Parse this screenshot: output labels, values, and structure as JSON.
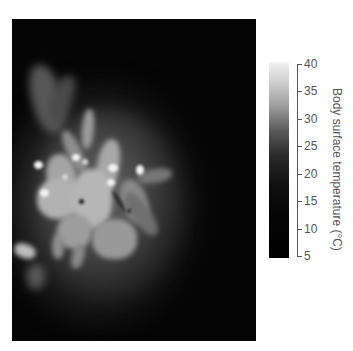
{
  "figure": {
    "type": "thermal-image"
  },
  "colorbar": {
    "title": "Body surface temperature (°C)",
    "ticks": [
      "40",
      "35",
      "30",
      "25",
      "20",
      "15",
      "10",
      "5"
    ],
    "min": 5,
    "max": 40,
    "gradient": "white (hot) to black (cold)",
    "colors": {
      "hot": "#f2f2f2",
      "cold": "#000000"
    }
  }
}
